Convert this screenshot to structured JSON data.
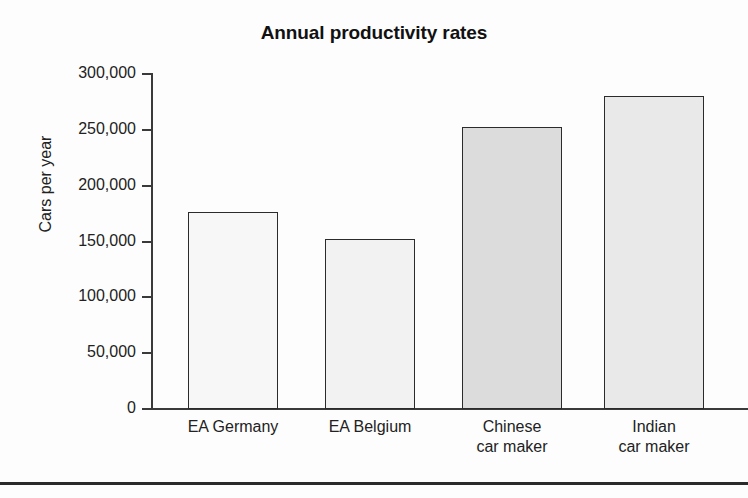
{
  "chart_data": {
    "type": "bar",
    "title": "Annual productivity rates",
    "xlabel": "",
    "ylabel": "Cars per year",
    "categories": [
      "EA Germany",
      "EA Belgium",
      "Chinese\ncar maker",
      "Indian\ncar maker"
    ],
    "values": [
      176000,
      152000,
      252500,
      280000
    ],
    "ylim": [
      0,
      300000
    ],
    "yticks": [
      0,
      50000,
      100000,
      150000,
      200000,
      250000,
      300000
    ],
    "ytick_labels": [
      "0",
      "50,000",
      "100,000",
      "150,000",
      "200,000",
      "250,000",
      "300,000"
    ],
    "grid": false,
    "legend": "none",
    "bar_colors": [
      "#f7f7f7",
      "#f2f2f2",
      "#dcdcdc",
      "#e9e9e9"
    ],
    "bar_edge_color": "#2b2b2b",
    "axis_color": "#3a3a3a",
    "text_color": "#222222",
    "background": "#fdfdfd"
  }
}
